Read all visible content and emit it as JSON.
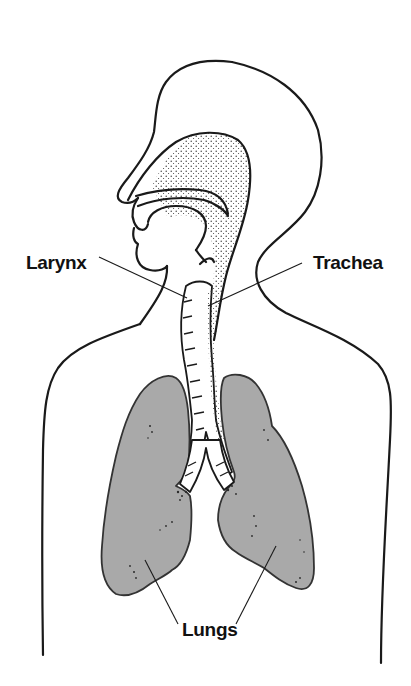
{
  "diagram": {
    "colors": {
      "background": "#ffffff",
      "outline": "#1a1a1a",
      "lung_fill": "#a9a9a9",
      "label_text": "#111111"
    },
    "labels": {
      "larynx": "Larynx",
      "trachea": "Trachea",
      "lungs": "Lungs"
    }
  }
}
